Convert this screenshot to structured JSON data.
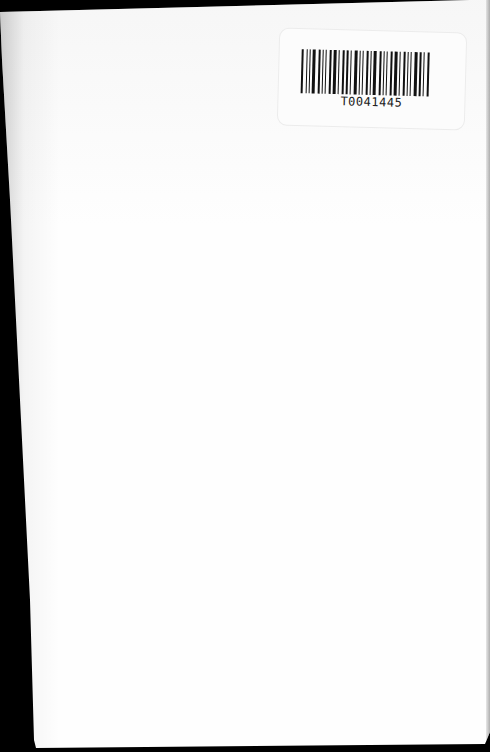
{
  "document": {
    "type": "scanned-blank-page",
    "label": {
      "barcode_text": "T0041445"
    }
  }
}
